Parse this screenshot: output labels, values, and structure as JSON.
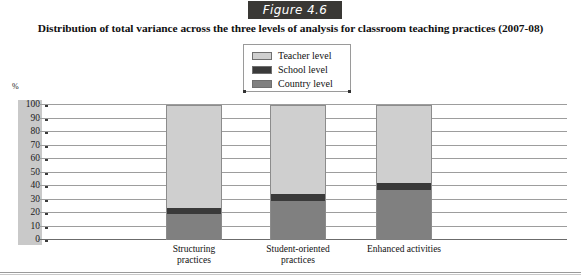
{
  "figure": {
    "badge_label": "Figure 4.6",
    "title": "Distribution of total variance across the three levels of analysis for classroom teaching practices (2007-08)"
  },
  "legend": {
    "items": [
      {
        "label": "Teacher level",
        "color": "#cfcfcf"
      },
      {
        "label": "School level",
        "color": "#3a3a3a"
      },
      {
        "label": "Country level",
        "color": "#808080"
      }
    ]
  },
  "axis": {
    "unit_label": "%",
    "ticks": [
      "100",
      "90",
      "80",
      "70",
      "60",
      "50",
      "40",
      "30",
      "20",
      "10",
      "0"
    ]
  },
  "categories": [
    {
      "line1": "Structuring",
      "line2": "practices"
    },
    {
      "line1": "Student-oriented",
      "line2": "practices"
    },
    {
      "line1": "Enhanced activities",
      "line2": ""
    }
  ],
  "chart_data": {
    "type": "bar",
    "subtype": "stacked-column-100",
    "title": "Distribution of total variance across the three levels of analysis for classroom teaching practices (2007-08)",
    "xlabel": "",
    "ylabel": "%",
    "ylim": [
      0,
      100
    ],
    "ytick_step": 10,
    "grid": true,
    "legend_position": "top-center",
    "categories": [
      "Structuring practices",
      "Student-oriented practices",
      "Enhanced activities"
    ],
    "series": [
      {
        "name": "Country level",
        "color": "#808080",
        "values": [
          19,
          29,
          37
        ]
      },
      {
        "name": "School level",
        "color": "#3a3a3a",
        "values": [
          5,
          5,
          5
        ]
      },
      {
        "name": "Teacher level",
        "color": "#cfcfcf",
        "values": [
          76,
          66,
          58
        ]
      }
    ]
  }
}
